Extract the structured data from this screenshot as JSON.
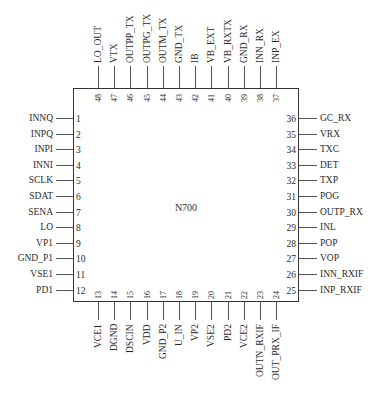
{
  "chip": {
    "name": "N700"
  },
  "pins": {
    "left": [
      {
        "num": "1",
        "name": "INNQ"
      },
      {
        "num": "2",
        "name": "INPQ"
      },
      {
        "num": "3",
        "name": "INPI"
      },
      {
        "num": "4",
        "name": "INNI"
      },
      {
        "num": "5",
        "name": "SCLK"
      },
      {
        "num": "6",
        "name": "SDAT"
      },
      {
        "num": "7",
        "name": "SENA"
      },
      {
        "num": "8",
        "name": "LO"
      },
      {
        "num": "9",
        "name": "VP1"
      },
      {
        "num": "10",
        "name": "GND_P1"
      },
      {
        "num": "11",
        "name": "VSE1"
      },
      {
        "num": "12",
        "name": "PD1"
      }
    ],
    "bottom": [
      {
        "num": "13",
        "name": "VCE1"
      },
      {
        "num": "14",
        "name": "DGND"
      },
      {
        "num": "15",
        "name": "DSCIN"
      },
      {
        "num": "16",
        "name": "VDD"
      },
      {
        "num": "17",
        "name": "GND_P2"
      },
      {
        "num": "18",
        "name": "U_IN"
      },
      {
        "num": "19",
        "name": "VP2"
      },
      {
        "num": "20",
        "name": "VSE2"
      },
      {
        "num": "21",
        "name": "PD2"
      },
      {
        "num": "22",
        "name": "VCE2"
      },
      {
        "num": "23",
        "name": "OUTN_RXIF"
      },
      {
        "num": "24",
        "name": "OUT_PRX_IF"
      }
    ],
    "right": [
      {
        "num": "25",
        "name": "INP_RXIF"
      },
      {
        "num": "26",
        "name": "INN_RXIF"
      },
      {
        "num": "27",
        "name": "VOP"
      },
      {
        "num": "28",
        "name": "POP"
      },
      {
        "num": "29",
        "name": "INL"
      },
      {
        "num": "30",
        "name": "OUTP_RX"
      },
      {
        "num": "31",
        "name": "POG"
      },
      {
        "num": "32",
        "name": "TXP"
      },
      {
        "num": "33",
        "name": "DET"
      },
      {
        "num": "34",
        "name": "TXC"
      },
      {
        "num": "35",
        "name": "VRX"
      },
      {
        "num": "36",
        "name": "GC_RX"
      }
    ],
    "top": [
      {
        "num": "37",
        "name": "INP_EX"
      },
      {
        "num": "38",
        "name": "INN_RX"
      },
      {
        "num": "39",
        "name": "GND_RX"
      },
      {
        "num": "40",
        "name": "VB_RXTX"
      },
      {
        "num": "41",
        "name": "VB_EXT"
      },
      {
        "num": "42",
        "name": "IB"
      },
      {
        "num": "43",
        "name": "GND_TX"
      },
      {
        "num": "44",
        "name": "OUTM_TX"
      },
      {
        "num": "45",
        "name": "OUTPG_TX"
      },
      {
        "num": "46",
        "name": "OUTPP_TX"
      },
      {
        "num": "47",
        "name": "VTX"
      },
      {
        "num": "48",
        "name": "LO_OUT"
      }
    ]
  },
  "colors": {
    "line": "#333333",
    "text": "#2a2a2a",
    "background": "#ffffff"
  }
}
